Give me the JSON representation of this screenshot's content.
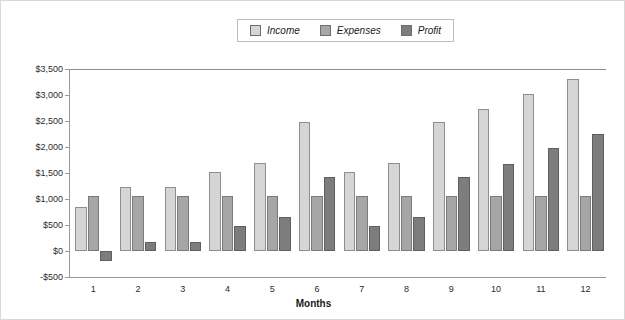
{
  "chart_data": {
    "type": "bar",
    "title": "",
    "xlabel": "Months",
    "ylabel": "",
    "categories": [
      "1",
      "2",
      "3",
      "4",
      "5",
      "6",
      "7",
      "8",
      "9",
      "10",
      "11",
      "12"
    ],
    "ylim": [
      -500,
      3500
    ],
    "ytick_step": 500,
    "ytick_labels": [
      "$3,500",
      "$3,000",
      "$2,500",
      "$2,000",
      "$1,500",
      "$1,000",
      "$500",
      "$0",
      "-$500"
    ],
    "ytick_values": [
      3500,
      3000,
      2500,
      2000,
      1500,
      1000,
      500,
      0,
      -500
    ],
    "grid": false,
    "legend_position": "top-center",
    "series": [
      {
        "name": "Income",
        "color": "#d5d5d5",
        "values": [
          850,
          1225,
          1225,
          1525,
          1700,
          2475,
          1525,
          1700,
          2475,
          2725,
          3025,
          3300
        ]
      },
      {
        "name": "Expenses",
        "color": "#a6a6a6",
        "values": [
          1050,
          1050,
          1050,
          1050,
          1050,
          1050,
          1050,
          1050,
          1050,
          1050,
          1050,
          1050
        ]
      },
      {
        "name": "Profit",
        "color": "#7d7d7d",
        "values": [
          -200,
          175,
          175,
          475,
          650,
          1425,
          475,
          650,
          1425,
          1675,
          1975,
          2250
        ]
      }
    ]
  }
}
